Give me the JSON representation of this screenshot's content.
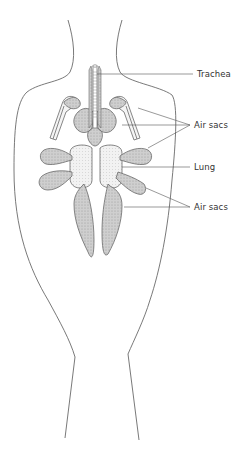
{
  "figure": {
    "colors": {
      "outline": "#6a6a6a",
      "organ_fill": "#c9c9c9",
      "organ_fill_light": "#e6e6e6",
      "lung_fill": "#efefef",
      "leader_line": "#555555",
      "text": "#333333"
    },
    "labels": [
      {
        "id": "trachea",
        "text": "Trachea",
        "x": 197,
        "y": 71
      },
      {
        "id": "air-sacs-upper",
        "text": "Air sacs",
        "x": 196,
        "y": 121
      },
      {
        "id": "lung",
        "text": "Lung",
        "x": 196,
        "y": 164
      },
      {
        "id": "air-sacs-lower",
        "text": "Air sacs",
        "x": 196,
        "y": 203
      }
    ]
  }
}
